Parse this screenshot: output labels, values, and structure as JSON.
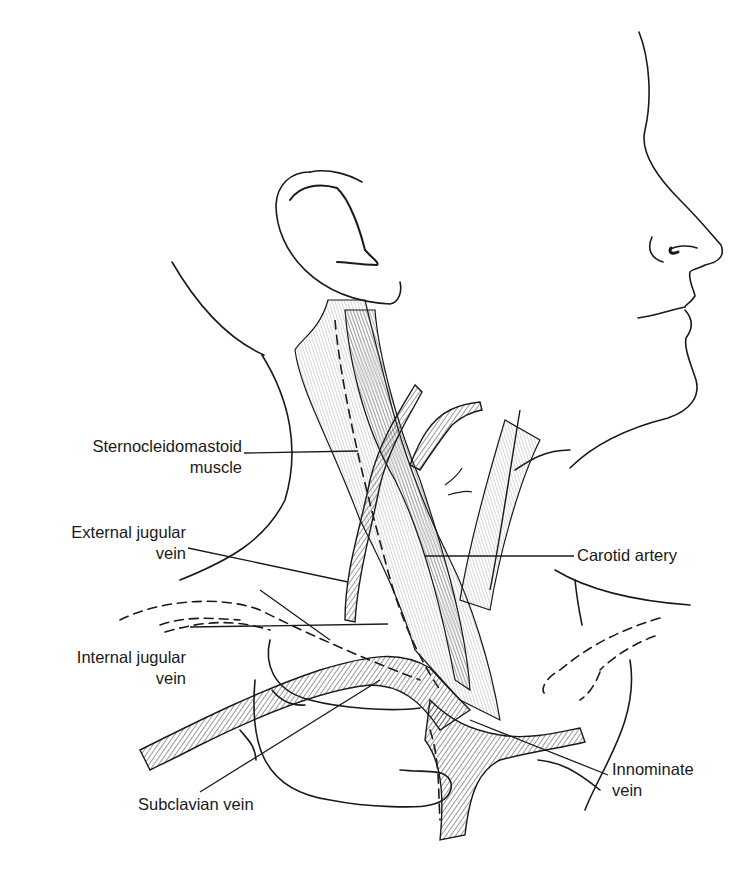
{
  "figure": {
    "line_color": "#1a1a1a",
    "background": "#ffffff"
  },
  "labels": {
    "sternocleidomastoid": {
      "line1": "Sternocleidomastoid",
      "line2": "muscle"
    },
    "external_jugular": {
      "line1": "External jugular",
      "line2": "vein"
    },
    "internal_jugular": {
      "line1": "Internal jugular",
      "line2": "vein"
    },
    "subclavian": {
      "line1": "Subclavian vein"
    },
    "carotid": {
      "line1": "Carotid artery"
    },
    "innominate": {
      "line1": "Innominate",
      "line2": "vein"
    }
  }
}
